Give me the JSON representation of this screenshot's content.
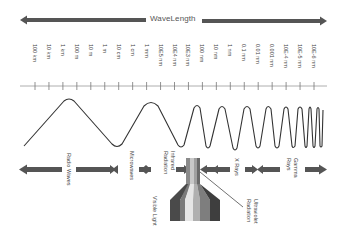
{
  "title": "WaveLength",
  "axis": {
    "ticks": [
      "100 km",
      "10 km",
      "1 km",
      "100 m",
      "10 m",
      "1 m",
      "10 cm",
      "1 cm",
      "1 mm",
      "10E5 nm",
      "10E4 nm",
      "10E3 nm",
      "100 nm",
      "10 nm",
      "1 nm",
      "0.1 nm",
      "0.01 nm",
      "0.001 nm",
      "10E-4 nm",
      "10E-5 nm",
      "10E-6 nm"
    ]
  },
  "bands": {
    "radio": "Radio Waves",
    "microwaves": "Microwaves",
    "infrared_1": "Infrared",
    "infrared_2": "Radiation",
    "visible": "Visible Light",
    "uv_1": "Ultraviolet",
    "uv_2": "Radiation",
    "xrays": "X Rays",
    "gamma_1": "Gamma",
    "gamma_2": "Rays"
  },
  "colors": {
    "arrow": "#555555",
    "wave": "#333333",
    "axis": "#888888",
    "prism": [
      "#4a4a4a",
      "#6e6e6e",
      "#8e8e8e",
      "#c4c4c4",
      "#e8e8e8",
      "#bdbdbd",
      "#8a8a8a",
      "#5e5e5e",
      "#3e3e3e"
    ]
  }
}
